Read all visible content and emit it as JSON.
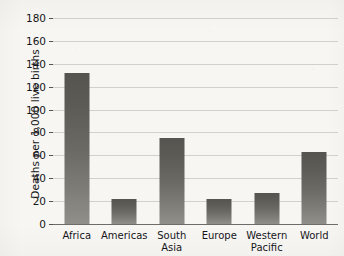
{
  "chart_data": {
    "type": "bar",
    "title": "",
    "xlabel": "",
    "ylabel": "Deaths per 1,000 live births",
    "ylim": [
      0,
      180
    ],
    "yticks": [
      0,
      20,
      40,
      60,
      80,
      100,
      120,
      140,
      160,
      180
    ],
    "ytick_labels": [
      "0",
      "20",
      "40",
      "60",
      "80",
      "100",
      "120",
      "140",
      "160",
      "180"
    ],
    "grid": true,
    "legend": null,
    "categories": [
      "Africa",
      "Americas",
      "South Asia",
      "Europe",
      "Western Pacific",
      "World"
    ],
    "category_lines": [
      [
        "Africa",
        ""
      ],
      [
        "Americas",
        ""
      ],
      [
        "South",
        "Asia"
      ],
      [
        "Europe",
        ""
      ],
      [
        "Western",
        "Pacific"
      ],
      [
        "World",
        ""
      ]
    ],
    "values": [
      132,
      22,
      75,
      22,
      27,
      63
    ],
    "bar_color_top": "#55544f",
    "bar_color_bottom": "#908f8a",
    "gridline_color": "#d2d0cc",
    "axis_color": "#6e6c69",
    "background_color": "#f7f6f3",
    "text_color": "#16161a"
  }
}
